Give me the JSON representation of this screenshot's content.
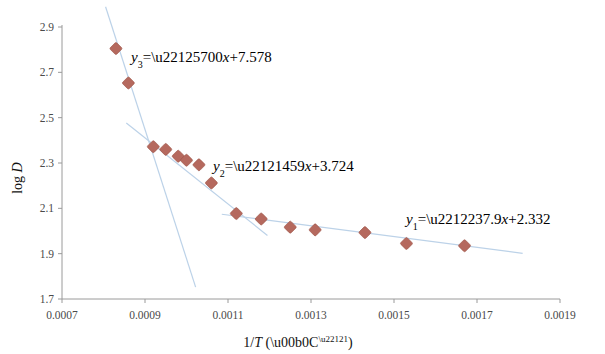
{
  "chart_data": {
    "type": "scatter",
    "title": "",
    "xlabel": "1/T (°C⁻¹)",
    "ylabel": "log D",
    "xlim": [
      0.0007,
      0.0019
    ],
    "ylim": [
      1.7,
      2.9
    ],
    "xticks": [
      "0.0007",
      "0.0009",
      "0.0011",
      "0.0013",
      "0.0015",
      "0.0017",
      "0.0019"
    ],
    "xtick_values": [
      0.0007,
      0.0009,
      0.0011,
      0.0013,
      0.0015,
      0.0017,
      0.0019
    ],
    "yticks": [
      "1.7",
      "1.9",
      "2.1",
      "2.3",
      "2.5",
      "2.7",
      "2.9"
    ],
    "ytick_values": [
      1.7,
      1.9,
      2.1,
      2.3,
      2.5,
      2.7,
      2.9
    ],
    "grid": false,
    "legend": "none",
    "marker_color": "#b5695e",
    "trendline_color": "#bcd2e8",
    "series": [
      {
        "name": "log D vs 1/T",
        "x": [
          0.00083,
          0.00086,
          0.00092,
          0.00095,
          0.00098,
          0.001,
          0.00103,
          0.00106,
          0.00112,
          0.00118,
          0.00125,
          0.00131,
          0.00143,
          0.00153,
          0.00167
        ],
        "y": [
          2.805,
          2.653,
          2.372,
          2.36,
          2.33,
          2.312,
          2.292,
          2.212,
          2.077,
          2.053,
          2.017,
          2.005,
          1.993,
          1.945,
          1.935
        ]
      }
    ],
    "fits": [
      {
        "id": "y1",
        "label": "y₁=−2379x+2.332",
        "label_parts": {
          "var": "y",
          "sub": "1",
          "body": "=−237.9",
          "xvar": "x",
          "tail": "+2.332"
        },
        "slope": -237.9,
        "intercept": 2.332,
        "x_start": 0.001085,
        "x_end": 0.00181
      },
      {
        "id": "y2",
        "label": "y₂=−1459x+3.724",
        "label_parts": {
          "var": "y",
          "sub": "2",
          "body": "=−1459",
          "xvar": "x",
          "tail": "+3.724"
        },
        "slope": -1459,
        "intercept": 3.724,
        "x_start": 0.000855,
        "x_end": 0.001195
      },
      {
        "id": "y3",
        "label": "y₃=−5700x+7.578",
        "label_parts": {
          "var": "y",
          "sub": "3",
          "body": "=−5700",
          "xvar": "x",
          "tail": "+7.578"
        },
        "slope": -5700,
        "intercept": 7.578,
        "x_start": 0.000805,
        "x_end": 0.001022
      }
    ]
  }
}
